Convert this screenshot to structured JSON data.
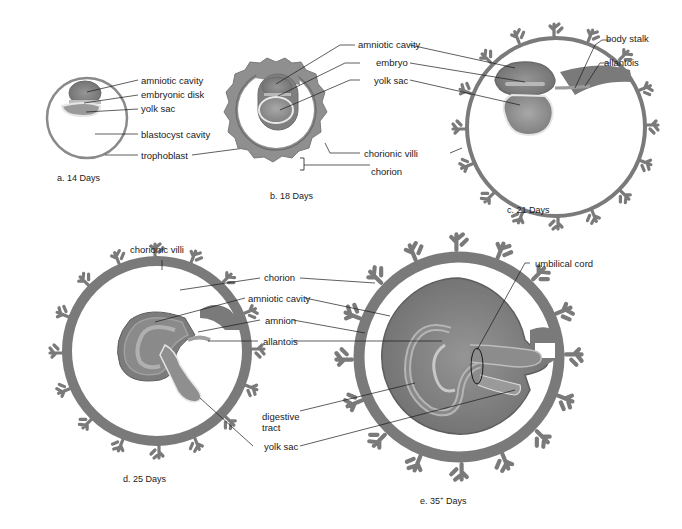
{
  "figure": {
    "colors": {
      "tissue_dark": "#7a7a7a",
      "tissue_mid": "#8f8f8f",
      "tissue_light": "#b5b5b5",
      "membrane_highlight": "#e8e8e8",
      "line": "#1a1a1a",
      "background": "#ffffff"
    },
    "panels": [
      {
        "id": "a",
        "caption": "a.  14 Days",
        "labels": [
          "amniotic cavity",
          "embryonic disk",
          "yolk sac",
          "blastocyst cavity",
          "trophoblast"
        ]
      },
      {
        "id": "b",
        "caption": "b.  18 Days",
        "labels": [
          "amniotic cavity",
          "embryo",
          "yolk sac",
          "chorionic villi",
          "chorion"
        ]
      },
      {
        "id": "c",
        "caption": "c.  21 Days",
        "labels": [
          "body stalk",
          "allantois"
        ]
      },
      {
        "id": "d",
        "caption": "d.  25 Days",
        "labels": [
          "chorionic villi",
          "chorion",
          "amniotic cavity",
          "amnion",
          "allantois",
          "digestive tract",
          "yolk sac"
        ]
      },
      {
        "id": "e",
        "caption_main": "e.  35",
        "caption_sup": "+",
        "caption_tail": " Days",
        "labels": [
          "umbilical cord"
        ]
      }
    ],
    "labels": {
      "a_amniotic_cavity": "amniotic cavity",
      "a_embryonic_disk": "embryonic disk",
      "a_yolk_sac": "yolk sac",
      "a_blastocyst_cavity": "blastocyst cavity",
      "a_trophoblast": "trophoblast",
      "b_amniotic_cavity": "amniotic cavity",
      "b_embryo": "embryo",
      "b_yolk_sac": "yolk sac",
      "b_chorionic_villi": "chorionic villi",
      "b_chorion": "chorion",
      "c_body_stalk": "body stalk",
      "c_allantois": "allantois",
      "d_chorionic_villi": "chorionic villi",
      "d_chorion": "chorion",
      "d_amniotic_cavity": "amniotic cavity",
      "d_amnion": "amnion",
      "d_allantois": "allantois",
      "d_digestive_tract_1": "digestive",
      "d_digestive_tract_2": "tract",
      "d_yolk_sac": "yolk sac",
      "e_umbilical_cord": "umbilical cord"
    },
    "captions": {
      "a": "a.  14 Days",
      "b": "b.  18 Days",
      "c": "c.  21 Days",
      "d": "d.  25 Days",
      "e_main": "e.  35",
      "e_sup": "+",
      "e_tail": " Days"
    }
  }
}
